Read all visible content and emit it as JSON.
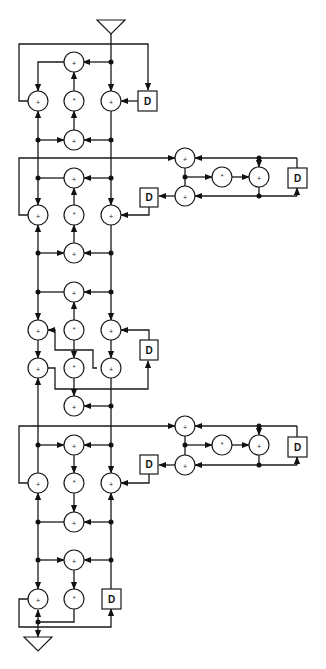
{
  "diagram": {
    "type": "signal-flow-graph",
    "colors": {
      "line": "#1a1a1a",
      "background": "#ffffff"
    },
    "symbols": {
      "adder": "+",
      "multiplier": "*",
      "delay": "D"
    },
    "input_port": {
      "shape": "triangle",
      "position": "top"
    },
    "output_port": {
      "shape": "triangle",
      "position": "bottom"
    },
    "delay_label": "D",
    "sections": [
      {
        "id": 1,
        "delays": 1,
        "adders": 4,
        "multipliers": 1
      },
      {
        "id": 2,
        "delays": 1,
        "adders": 4,
        "multipliers": 1,
        "side_cluster": {
          "delays": 2,
          "adders": 3,
          "multipliers": 1
        }
      },
      {
        "id": 3,
        "delays": 1,
        "adders": 6,
        "multipliers": 2
      },
      {
        "id": 4,
        "delays": 1,
        "adders": 4,
        "multipliers": 1,
        "side_cluster": {
          "delays": 2,
          "adders": 3,
          "multipliers": 1
        }
      },
      {
        "id": 5,
        "delays": 1,
        "adders": 2,
        "multipliers": 1
      }
    ]
  }
}
